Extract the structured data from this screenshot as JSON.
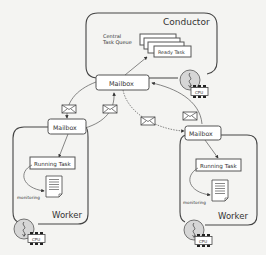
{
  "diagram": {
    "type": "architecture",
    "conductor": {
      "title": "Conductor",
      "queue_label_line1": "Central",
      "queue_label_line2": "Task Queue",
      "ready_task_label": "Ready Task",
      "mailbox_label": "Mailbox",
      "cpu_label": "CPU"
    },
    "workers": [
      {
        "title": "Worker",
        "mailbox_label": "Mailbox",
        "running_task_label": "Running Task",
        "monitoring_label": "monitoring",
        "cpu_label": "CPU"
      },
      {
        "title": "Worker",
        "mailbox_label": "Mailbox",
        "running_task_label": "Running Task",
        "monitoring_label": "monitoring",
        "cpu_label": "CPU"
      }
    ],
    "icons": {
      "message": "envelope-icon",
      "cpu": "cpu-chip-icon",
      "process": "process-circle-icon",
      "report": "document-icon"
    },
    "colors": {
      "background": "#f4f4f2",
      "stroke": "#444444",
      "box_fill": "#ffffff",
      "process_fill": "#d8d8d8"
    }
  }
}
